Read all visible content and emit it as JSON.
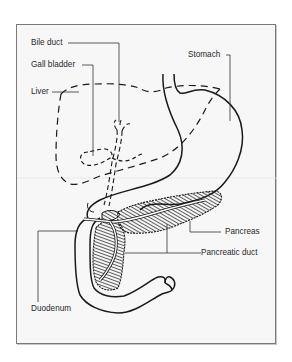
{
  "figure": {
    "type": "anatomical-diagram",
    "labels": [
      {
        "id": "bile-duct",
        "text": "Bile duct"
      },
      {
        "id": "gall-bladder",
        "text": "Gall bladder"
      },
      {
        "id": "liver",
        "text": "Liver"
      },
      {
        "id": "stomach",
        "text": "Stomach"
      },
      {
        "id": "pancreas",
        "text": "Pancreas"
      },
      {
        "id": "pancreatic-duct",
        "text": "Pancreatic duct"
      },
      {
        "id": "duodenum",
        "text": "Duodenum"
      }
    ],
    "colors": {
      "frame_border": "#7a7a7a",
      "frame_background": "#f7f7f7",
      "line": "#1a1a1a",
      "leader_line": "#333333",
      "label_text": "#2a2a2a"
    }
  }
}
